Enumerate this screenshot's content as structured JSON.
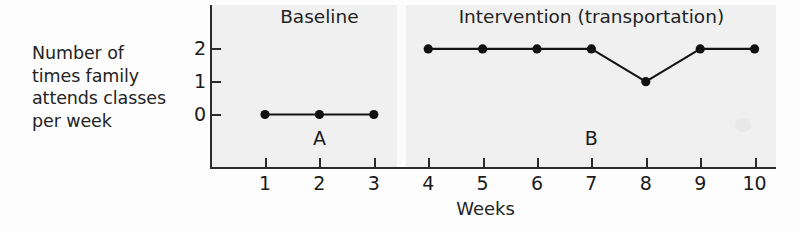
{
  "chart_data": {
    "type": "line",
    "title": "",
    "xlabel": "Weeks",
    "ylabel": "Number of\ntimes family\nattends classes\nper week",
    "x": [
      1,
      2,
      3,
      4,
      5,
      6,
      7,
      8,
      9,
      10
    ],
    "xtick_labels": [
      "1",
      "2",
      "3",
      "4",
      "5",
      "6",
      "7",
      "8",
      "9",
      "10"
    ],
    "ytick_labels": [
      "0",
      "1",
      "2"
    ],
    "ytick_values": [
      0,
      1,
      2
    ],
    "ylim": [
      0,
      2
    ],
    "xlim": [
      1,
      10
    ],
    "grid": false,
    "legend": "none",
    "series": [
      {
        "name": "Baseline",
        "phase_letter": "A",
        "x": [
          1,
          2,
          3
        ],
        "values": [
          0,
          0,
          0
        ]
      },
      {
        "name": "Intervention (transportation)",
        "phase_letter": "B",
        "x": [
          4,
          5,
          6,
          7,
          8,
          9,
          10
        ],
        "values": [
          2,
          2,
          2,
          2,
          1,
          2,
          2
        ]
      }
    ],
    "annotations": [
      {
        "text": "Baseline",
        "role": "phase-header"
      },
      {
        "text": "Intervention (transportation)",
        "role": "phase-header"
      },
      {
        "text": "A",
        "role": "phase-label"
      },
      {
        "text": "B",
        "role": "phase-label"
      }
    ],
    "colors": {
      "line": "#141414",
      "marker": "#111111",
      "axis": "#2b2b2b",
      "plot_background": "#f0f0f0",
      "page_background": "#fdfdfd",
      "text": "#1b1b1b"
    }
  },
  "axis": {
    "y_caption": "Number of\ntimes family\nattends classes\nper week",
    "x_title": "Weeks",
    "y_ticks": [
      {
        "label": "0"
      },
      {
        "label": "1"
      },
      {
        "label": "2"
      }
    ],
    "x_ticks": [
      {
        "label": "1"
      },
      {
        "label": "2"
      },
      {
        "label": "3"
      },
      {
        "label": "4"
      },
      {
        "label": "5"
      },
      {
        "label": "6"
      },
      {
        "label": "7"
      },
      {
        "label": "8"
      },
      {
        "label": "9"
      },
      {
        "label": "10"
      }
    ]
  },
  "phases": {
    "baseline": {
      "title": "Baseline",
      "letter": "A"
    },
    "intervention": {
      "title": "Intervention (transportation)",
      "letter": "B"
    }
  }
}
